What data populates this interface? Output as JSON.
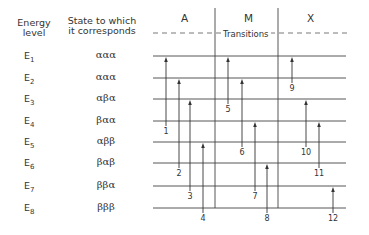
{
  "headers": {
    "energy_level": [
      "Energy",
      "level"
    ],
    "state": [
      "State to which",
      "it corresponds"
    ]
  },
  "columns": [
    "A",
    "M",
    "X"
  ],
  "transitions_label": "Transitions",
  "levels": [
    {
      "label": "E",
      "sub": "1",
      "state": "ααα"
    },
    {
      "label": "E",
      "sub": "2",
      "state": "ααα"
    },
    {
      "label": "E",
      "sub": "3",
      "state": "αβα"
    },
    {
      "label": "E",
      "sub": "4",
      "state": "βαα"
    },
    {
      "label": "E",
      "sub": "5",
      "state": "αββ"
    },
    {
      "label": "E",
      "sub": "6",
      "state": "βαβ"
    },
    {
      "label": "E",
      "sub": "7",
      "state": "ββα"
    },
    {
      "label": "E",
      "sub": "8",
      "state": "βββ"
    }
  ],
  "transitions": [
    {
      "number": "1",
      "from": 4,
      "to": 1,
      "group": "A"
    },
    {
      "number": "2",
      "from": 6,
      "to": 2,
      "group": "A"
    },
    {
      "number": "3",
      "from": 7,
      "to": 3,
      "group": "A"
    },
    {
      "number": "4",
      "from": 8,
      "to": 5,
      "group": "A"
    },
    {
      "number": "5",
      "from": 3,
      "to": 1,
      "group": "M"
    },
    {
      "number": "6",
      "from": 5,
      "to": 2,
      "group": "M"
    },
    {
      "number": "7",
      "from": 7,
      "to": 4,
      "group": "M"
    },
    {
      "number": "8",
      "from": 8,
      "to": 6,
      "group": "M"
    },
    {
      "number": "9",
      "from": 2,
      "to": 1,
      "group": "X"
    },
    {
      "number": "10",
      "from": 5,
      "to": 3,
      "group": "X"
    },
    {
      "number": "11",
      "from": 6,
      "to": 4,
      "group": "X"
    },
    {
      "number": "12",
      "from": 8,
      "to": 7,
      "group": "X"
    }
  ]
}
